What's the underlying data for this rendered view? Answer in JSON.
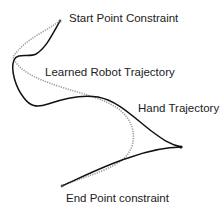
{
  "labels": {
    "start": "Start Point Constraint",
    "learned": "Learned Robot Trajectory",
    "hand": "Hand Trajectory",
    "end": "End Point constraint"
  },
  "colors": {
    "hand_trajectory": "#111111",
    "robot_trajectory": "#9a9a9a",
    "text": "#222222"
  },
  "paths": {
    "hand_trajectory": "M60,21 C52,35 46,48 36,54 C28,58 18,52 14,60 C10,70 16,88 24,98 C30,106 36,108 48,104 C62,99 80,94 98,97 C118,101 132,116 150,130 C162,139 170,145 182,147 C168,147 150,150 128,158 C106,165 84,176 62,186",
    "robot_trajectory": "M60,21 C44,32 24,40 13,57 C18,70 34,78 58,86 C82,94 104,98 120,110 C132,120 136,134 132,146 C128,158 118,164 104,170 C90,176 76,180 62,186"
  }
}
